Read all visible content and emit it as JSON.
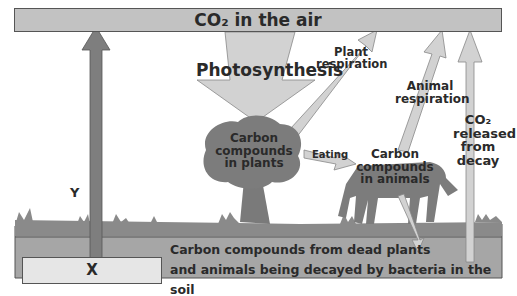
{
  "diagram": {
    "top_bar": {
      "label": "CO₂ in the air"
    },
    "processes": {
      "photosynthesis": "Photosynthesis",
      "plant_respiration": "Plant respiration",
      "animal_respiration": "Animal respiration",
      "co2_decay": "CO₂ released from decay",
      "eating": "Eating"
    },
    "stores": {
      "plants": "Carbon compounds in plants",
      "animals": "Carbon compounds in animals",
      "soil_line1": "Carbon compounds from dead plants",
      "soil_line2": "and animals being decayed by bacteria in the soil"
    },
    "unknowns": {
      "x_label": "X",
      "y_label": "Y"
    },
    "colors": {
      "top_bar": "#c2c2c2",
      "arrow_light": "#d2d2d2",
      "arrow_dark": "#808080",
      "organism": "#7c7c7c",
      "soil": "#a8a8a8",
      "ground": "#8a8a8a",
      "x_box": "#e6e6e6"
    }
  }
}
